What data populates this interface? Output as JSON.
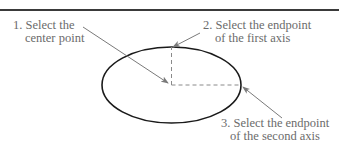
{
  "diagram": {
    "colors": {
      "rule": "#3a3a3a",
      "ellipse": "#1a1a1a",
      "arrow": "#7a7a7a",
      "dashed": "#8a8a8a",
      "text": "#6b6b6b"
    },
    "ellipse": {
      "cx": 171.5,
      "cy": 85,
      "rx": 69.5,
      "ry": 38
    },
    "steps": [
      {
        "number": "1.",
        "line1": "1. Select the",
        "line2": "center point",
        "target": "center point"
      },
      {
        "number": "2.",
        "line1": "2. Select the endpoint",
        "line2": "of the first axis",
        "target": "top of ellipse (minor axis endpoint)"
      },
      {
        "number": "3.",
        "line1": "3. Select the endpoint",
        "line2": "of the second axis",
        "target": "right of ellipse (major axis endpoint)"
      }
    ]
  }
}
